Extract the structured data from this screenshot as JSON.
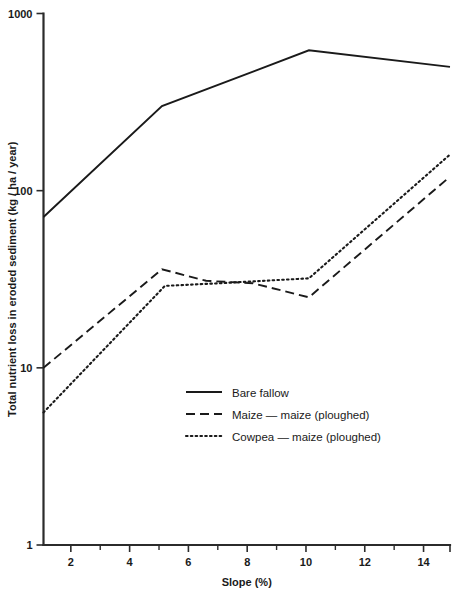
{
  "chart_data": {
    "type": "line",
    "title": "",
    "xlabel": "Slope (%)",
    "ylabel": "Total nutrient loss in eroded sediment (kg / ha / year)",
    "xlim": [
      1.07,
      14.9
    ],
    "ylim": [
      1,
      1000
    ],
    "yscale": "log",
    "xscale": "linear",
    "grid": false,
    "legend_position": "center",
    "x_ticks_major": [
      2,
      4,
      6,
      8,
      10,
      12,
      14
    ],
    "x_tick_labels": [
      "2",
      "4",
      "6",
      "8",
      "10",
      "12",
      "14"
    ],
    "x_ticks_minor": [
      3,
      5,
      7,
      9,
      11,
      13
    ],
    "y_ticks": [
      1,
      10,
      100,
      1000
    ],
    "y_tick_labels": [
      "1",
      "10",
      "100",
      "1000"
    ],
    "series": [
      {
        "name": "Bare fallow",
        "style": "solid",
        "x": [
          1.07,
          5.1,
          10.1,
          14.9
        ],
        "values": [
          71,
          300,
          620,
          500
        ]
      },
      {
        "name": "Maize — maize (ploughed)",
        "style": "dashed",
        "x": [
          1.07,
          5.1,
          6.6,
          8.2,
          10.1,
          14.9
        ],
        "values": [
          10,
          36,
          31,
          30,
          25,
          120
        ]
      },
      {
        "name": "Cowpea — maize (ploughed)",
        "style": "dotted",
        "x": [
          1.07,
          5.2,
          7.0,
          10.1,
          14.9
        ],
        "values": [
          5.6,
          29,
          30,
          32,
          160
        ]
      }
    ]
  },
  "legend": {
    "items": [
      {
        "label": "Bare fallow",
        "style": "solid"
      },
      {
        "label": "Maize — maize (ploughed)",
        "style": "dashed"
      },
      {
        "label": "Cowpea — maize (ploughed)",
        "style": "dotted"
      }
    ]
  },
  "colors": {
    "ink": "#1a1a1a",
    "axis": "#2b2b2b",
    "background": "#ffffff"
  }
}
